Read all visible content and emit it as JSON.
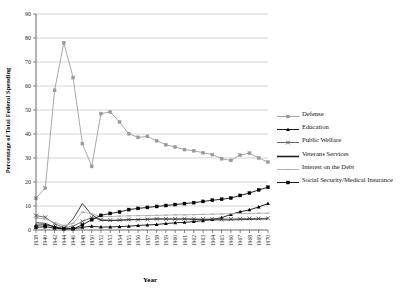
{
  "chart_data": {
    "type": "line",
    "title": "",
    "xlabel": "Year",
    "ylabel": "Percentage of Total Federal Spending",
    "ylim": [
      0,
      90
    ],
    "yticks": [
      0,
      10,
      20,
      30,
      40,
      50,
      60,
      70,
      80,
      90
    ],
    "grid": true,
    "legend_position": "right",
    "categories": [
      "1938",
      "1940",
      "1942",
      "1944",
      "1946",
      "1948",
      "1950",
      "1952",
      "1953",
      "1954",
      "1955",
      "1956",
      "1957",
      "1958",
      "1959",
      "1960",
      "1961",
      "1962",
      "1963",
      "1964",
      "1965",
      "1966",
      "1967",
      "1968",
      "1969",
      "1970"
    ],
    "series": [
      {
        "name": "Defense",
        "marker": "square",
        "color": "#999999",
        "values": [
          13.2,
          17.5,
          58.2,
          78.0,
          63.5,
          36.0,
          26.5,
          48.5,
          49.2,
          45.0,
          40.1,
          38.6,
          39.0,
          37.2,
          35.5,
          34.6,
          33.5,
          33.0,
          32.2,
          31.4,
          29.7,
          29.0,
          31.2,
          32.0,
          30.0,
          28.3
        ]
      },
      {
        "name": "Education",
        "marker": "triangle",
        "color": "#000000",
        "values": [
          2.0,
          2.2,
          1.4,
          0.6,
          0.5,
          1.1,
          1.6,
          1.2,
          1.3,
          1.4,
          1.6,
          1.9,
          2.1,
          2.3,
          2.7,
          3.0,
          3.2,
          3.5,
          3.9,
          4.4,
          5.1,
          6.5,
          7.6,
          8.4,
          9.6,
          11.0
        ]
      },
      {
        "name": "Public Welfare",
        "marker": "cross",
        "color": "#555555",
        "values": [
          6.0,
          5.3,
          2.6,
          1.0,
          1.5,
          3.6,
          5.2,
          4.3,
          4.1,
          4.2,
          4.4,
          4.3,
          4.4,
          4.6,
          4.6,
          4.6,
          4.7,
          4.6,
          4.6,
          4.6,
          4.5,
          4.6,
          4.7,
          4.8,
          4.8,
          4.9
        ]
      },
      {
        "name": "Veterans Services",
        "marker": "none",
        "color": "#222222",
        "values": [
          3.0,
          2.8,
          1.2,
          0.5,
          4.6,
          11.0,
          6.4,
          4.0,
          3.9,
          4.0,
          4.2,
          4.4,
          4.5,
          4.6,
          4.6,
          4.5,
          4.5,
          4.4,
          4.3,
          4.2,
          4.2,
          4.2,
          4.3,
          4.4,
          4.5,
          4.6
        ]
      },
      {
        "name": "Interest on the Debt",
        "marker": "dash",
        "color": "#aaaaaa",
        "values": [
          5.0,
          4.6,
          3.1,
          1.9,
          2.8,
          7.5,
          6.7,
          5.6,
          5.6,
          5.8,
          5.9,
          6.0,
          6.0,
          6.1,
          6.2,
          6.3,
          6.3,
          6.4,
          6.5,
          6.6,
          6.7,
          6.8,
          6.9,
          6.9,
          7.0,
          7.0
        ]
      },
      {
        "name": "Social Security/Medical Insurance",
        "marker": "square",
        "color": "#000000",
        "values": [
          1.1,
          1.4,
          0.8,
          0.4,
          0.5,
          2.1,
          4.3,
          6.1,
          6.9,
          7.5,
          8.5,
          9.0,
          9.4,
          9.8,
          10.2,
          10.6,
          11.0,
          11.4,
          11.9,
          12.4,
          12.8,
          13.3,
          14.4,
          15.4,
          16.7,
          17.8
        ]
      }
    ]
  },
  "legend": {
    "items": [
      {
        "label": "Defense"
      },
      {
        "label": "Education"
      },
      {
        "label": "Public Welfare"
      },
      {
        "label": "Veterans Services"
      },
      {
        "label": "Interest on the Debt"
      },
      {
        "label": "Social Security/Medical Insurance"
      }
    ]
  }
}
